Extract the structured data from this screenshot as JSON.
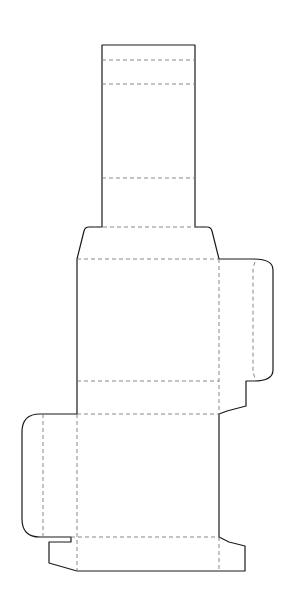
{
  "diagram": {
    "type": "packaging-dieline",
    "colors": {
      "background": "#ffffff",
      "cut_line": "#1a1a1a",
      "fold_line": "#7a7a7a"
    },
    "legend": {
      "cut_line_style": "solid",
      "fold_line_style": "dashed"
    },
    "panels": [
      {
        "name": "top-tuck-flap",
        "x": 102,
        "y": 45,
        "w": 93,
        "h": 182
      },
      {
        "name": "front-panel",
        "x": 77,
        "y": 259,
        "w": 142,
        "h": 122
      },
      {
        "name": "bottom-panel",
        "x": 77,
        "y": 381,
        "w": 142,
        "h": 33
      },
      {
        "name": "back-panel",
        "x": 77,
        "y": 414,
        "w": 142,
        "h": 123
      },
      {
        "name": "right-side-flap",
        "x": 219,
        "y": 259,
        "w": 54,
        "h": 122
      },
      {
        "name": "left-side-flap",
        "x": 22,
        "y": 414,
        "w": 55,
        "h": 123
      }
    ]
  }
}
